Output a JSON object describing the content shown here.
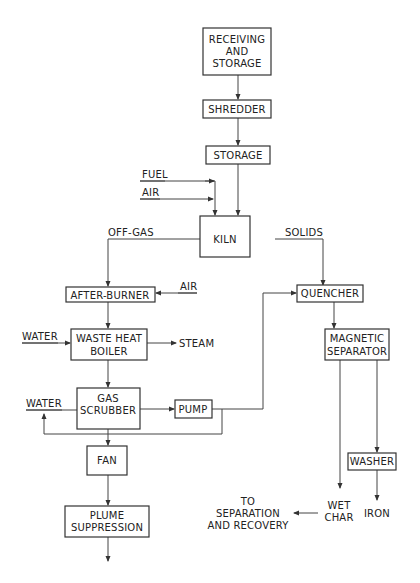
{
  "diagram": {
    "type": "process-flow",
    "nodes": {
      "receiving": {
        "line1": "RECEIVING",
        "line2": "AND",
        "line3": "STORAGE"
      },
      "shredder": {
        "label": "SHREDDER"
      },
      "storage": {
        "label": "STORAGE"
      },
      "kiln": {
        "label": "KILN"
      },
      "afterburner": {
        "label": "AFTER-BURNER"
      },
      "boiler": {
        "line1": "WASTE HEAT",
        "line2": "BOILER"
      },
      "scrubber": {
        "line1": "GAS",
        "line2": "SCRUBBER"
      },
      "pump": {
        "label": "PUMP"
      },
      "fan": {
        "label": "FAN"
      },
      "plume": {
        "line1": "PLUME",
        "line2": "SUPPRESSION"
      },
      "quencher": {
        "label": "QUENCHER"
      },
      "magsep": {
        "line1": "MAGNETIC",
        "line2": "SEPARATOR"
      },
      "washer": {
        "label": "WASHER"
      }
    },
    "labels": {
      "fuel": "FUEL",
      "air_kiln": "AIR",
      "offgas": "OFF-GAS",
      "solids": "SOLIDS",
      "air_afterburner": "AIR",
      "water_boiler": "WATER",
      "steam": "STEAM",
      "water_scrubber": "WATER",
      "to_line1": "TO",
      "to_line2": "SEPARATION",
      "to_line3": "AND RECOVERY",
      "wet": "WET",
      "char": "CHAR",
      "iron": "IRON"
    },
    "edges": [
      [
        "RECEIVING AND STORAGE",
        "SHREDDER"
      ],
      [
        "SHREDDER",
        "STORAGE"
      ],
      [
        "STORAGE",
        "KILN"
      ],
      [
        "FUEL",
        "KILN"
      ],
      [
        "AIR",
        "KILN"
      ],
      [
        "KILN",
        "AFTER-BURNER",
        "OFF-GAS"
      ],
      [
        "KILN",
        "QUENCHER",
        "SOLIDS"
      ],
      [
        "AIR",
        "AFTER-BURNER"
      ],
      [
        "AFTER-BURNER",
        "WASTE HEAT BOILER"
      ],
      [
        "WATER",
        "WASTE HEAT BOILER"
      ],
      [
        "WASTE HEAT BOILER",
        "STEAM"
      ],
      [
        "WASTE HEAT BOILER",
        "GAS SCRUBBER"
      ],
      [
        "GAS SCRUBBER",
        "PUMP"
      ],
      [
        "PUMP",
        "QUENCHER"
      ],
      [
        "PUMP",
        "WATER (recycle)"
      ],
      [
        "GAS SCRUBBER",
        "FAN"
      ],
      [
        "FAN",
        "PLUME SUPPRESSION"
      ],
      [
        "QUENCHER",
        "MAGNETIC SEPARATOR"
      ],
      [
        "MAGNETIC SEPARATOR",
        "WET CHAR"
      ],
      [
        "MAGNETIC SEPARATOR",
        "WASHER"
      ],
      [
        "WASHER",
        "IRON"
      ],
      [
        "WET CHAR",
        "TO SEPARATION AND RECOVERY"
      ]
    ]
  }
}
